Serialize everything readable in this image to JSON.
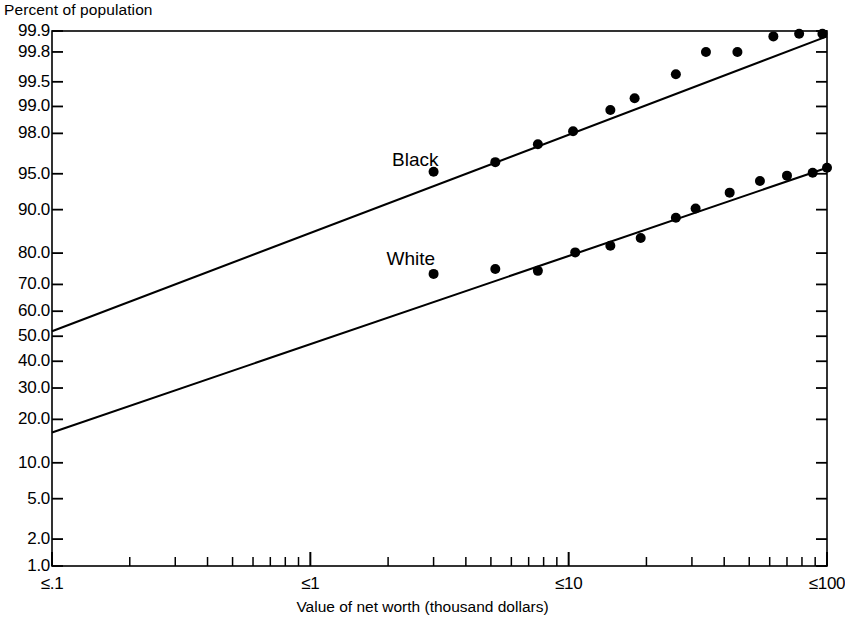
{
  "chart_data": {
    "type": "line",
    "title": "",
    "ylabel": "Percent of population",
    "xlabel": "Value of net worth (thousand dollars)",
    "y_scale": "probit",
    "x_scale": "log",
    "ylim": [
      1.0,
      99.9
    ],
    "xlim": [
      0.1,
      100
    ],
    "grid": false,
    "legend_position": "inline-annotation",
    "ytick_labels": [
      "99.9",
      "99.8",
      "99.5",
      "99.0",
      "98.0",
      "95.0",
      "90.0",
      "80.0",
      "70.0",
      "60.0",
      "50.0",
      "40.0",
      "30.0",
      "20.0",
      "10.0",
      "5.0",
      "2.0",
      "1.0"
    ],
    "ytick_values": [
      99.9,
      99.8,
      99.5,
      99.0,
      98.0,
      95.0,
      90.0,
      80.0,
      70.0,
      60.0,
      50.0,
      40.0,
      30.0,
      20.0,
      10.0,
      5.0,
      2.0,
      1.0
    ],
    "xtick_labels": [
      "≤.1",
      "≤1",
      "≤10",
      "≤100"
    ],
    "xtick_values": [
      0.1,
      1,
      10,
      100
    ],
    "x_minor_ticks": [
      0.2,
      0.3,
      0.4,
      0.5,
      0.6,
      0.7,
      0.8,
      0.9,
      2,
      3,
      4,
      5,
      6,
      7,
      8,
      9,
      20,
      30,
      40,
      50,
      60,
      70,
      80,
      90
    ],
    "series": [
      {
        "name": "Black",
        "color": "#000000",
        "fit_line": {
          "x": [
            0.1,
            100
          ],
          "y": [
            52.0,
            99.88
          ]
        },
        "points": [
          {
            "x": 3.0,
            "y": 95.2
          },
          {
            "x": 5.2,
            "y": 96.1
          },
          {
            "x": 7.6,
            "y": 97.4
          },
          {
            "x": 10.4,
            "y": 98.1
          },
          {
            "x": 14.5,
            "y": 98.9
          },
          {
            "x": 18.0,
            "y": 99.2
          },
          {
            "x": 26.0,
            "y": 99.6
          },
          {
            "x": 34.0,
            "y": 99.8
          },
          {
            "x": 45.0,
            "y": 99.8
          },
          {
            "x": 62.0,
            "y": 99.88
          },
          {
            "x": 78.0,
            "y": 99.89
          },
          {
            "x": 96.0,
            "y": 99.89
          }
        ]
      },
      {
        "name": "White",
        "color": "#000000",
        "fit_line": {
          "x": [
            0.1,
            100
          ],
          "y": [
            16.5,
            95.6
          ]
        },
        "points": [
          {
            "x": 3.0,
            "y": 73.6
          },
          {
            "x": 5.2,
            "y": 75.2
          },
          {
            "x": 7.6,
            "y": 74.6
          },
          {
            "x": 10.6,
            "y": 80.2
          },
          {
            "x": 14.5,
            "y": 82.0
          },
          {
            "x": 19.0,
            "y": 84.0
          },
          {
            "x": 26.0,
            "y": 88.5
          },
          {
            "x": 31.0,
            "y": 90.2
          },
          {
            "x": 42.0,
            "y": 92.7
          },
          {
            "x": 55.0,
            "y": 94.2
          },
          {
            "x": 70.0,
            "y": 94.8
          },
          {
            "x": 88.0,
            "y": 95.1
          },
          {
            "x": 100.0,
            "y": 95.6
          }
        ]
      }
    ],
    "annotations": [
      {
        "text": "Black",
        "x": 2.55,
        "y": 96.3
      },
      {
        "text": "White",
        "x": 2.45,
        "y": 78.2
      }
    ]
  },
  "plot_geometry": {
    "left": 52,
    "right": 827,
    "top": 31,
    "bottom": 566
  }
}
